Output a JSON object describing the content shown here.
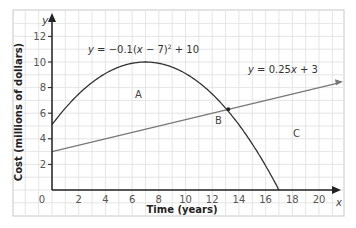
{
  "chart_data": {
    "type": "line",
    "title": "",
    "xlabel": "Time (years)",
    "ylabel": "Cost (millions of dollars)",
    "x_axis_symbol": "x",
    "y_axis_symbol": "y",
    "xlim": [
      0,
      21
    ],
    "ylim": [
      0,
      13
    ],
    "x_ticks": [
      0,
      2,
      4,
      6,
      8,
      10,
      12,
      14,
      16,
      18,
      20
    ],
    "y_ticks": [
      2,
      4,
      6,
      8,
      10,
      12
    ],
    "grid": true,
    "series": [
      {
        "name": "y = −0.1(x − 7)² + 10",
        "kind": "parabola",
        "equation": {
          "a": -0.1,
          "h": 7,
          "k": 10
        },
        "x_range": [
          0,
          17
        ],
        "color": "#333333",
        "points": [
          [
            0,
            5.1
          ],
          [
            2,
            7.5
          ],
          [
            4,
            9.1
          ],
          [
            7,
            10
          ],
          [
            10,
            9.1
          ],
          [
            12,
            7.5
          ],
          [
            13.2,
            6.2
          ],
          [
            15,
            3.6
          ],
          [
            17,
            0
          ]
        ]
      },
      {
        "name": "y = 0.25x + 3",
        "kind": "linear",
        "equation": {
          "m": 0.25,
          "b": 3
        },
        "x_range": [
          0,
          21.5
        ],
        "color": "#777777",
        "points": [
          [
            0,
            3
          ],
          [
            4,
            4
          ],
          [
            8,
            5
          ],
          [
            12,
            6
          ],
          [
            16,
            7
          ],
          [
            20,
            8
          ],
          [
            21.5,
            8.4
          ]
        ]
      }
    ],
    "intersection": {
      "x": 13.2,
      "y": 6.3
    },
    "annotations": [
      {
        "text": "y = −0.1(x − 7)² + 10",
        "x": 3.6,
        "y": 10.8
      },
      {
        "text": "y = 0.25x + 3",
        "x": 14.7,
        "y": 9.5
      },
      {
        "text": "A",
        "x": 7.8,
        "y": 7.2
      },
      {
        "text": "B",
        "x": 12.5,
        "y": 5.2
      },
      {
        "text": "C",
        "x": 18.2,
        "y": 4.1
      }
    ]
  },
  "labels": {
    "eq_parabola_prefix": "y = −0.1(",
    "eq_parabola_x": "x",
    "eq_parabola_mid": " − 7)",
    "eq_parabola_sup": "2",
    "eq_parabola_suffix": " + 10",
    "eq_line_y": "y",
    "eq_line_mid": " = 0.25",
    "eq_line_x": "x",
    "eq_line_suffix": " + 3",
    "eq_parabola_y": "y",
    "region_a": "A",
    "region_b": "B",
    "region_c": "C",
    "origin": "0"
  }
}
